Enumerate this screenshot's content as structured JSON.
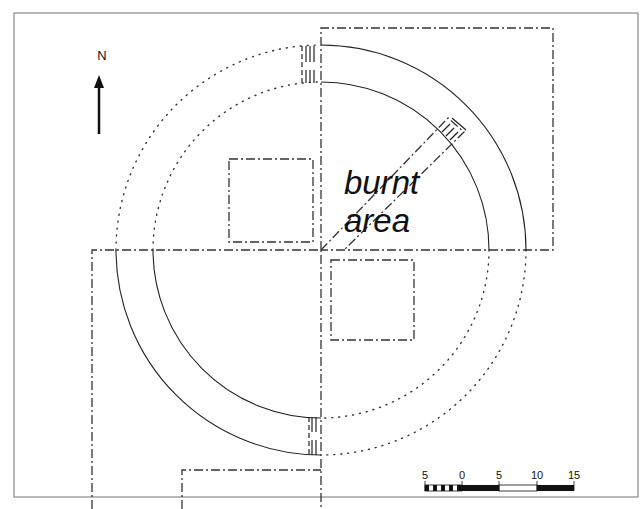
{
  "figure": {
    "type": "archaeological site plan",
    "north_label": "N",
    "annotation": {
      "line1": "burnt",
      "line2": "area"
    },
    "scale_bar": {
      "ticks": [
        "5",
        "0",
        "5",
        "10",
        "15"
      ],
      "segments": [
        {
          "from": -5,
          "to": 0,
          "style": "checkered"
        },
        {
          "from": 0,
          "to": 5,
          "style": "black"
        },
        {
          "from": 5,
          "to": 10,
          "style": "white"
        },
        {
          "from": 10,
          "to": 15,
          "style": "black"
        }
      ]
    },
    "colors": {
      "line": "#222222",
      "frame": "#888888",
      "background": "#ffffff"
    }
  }
}
